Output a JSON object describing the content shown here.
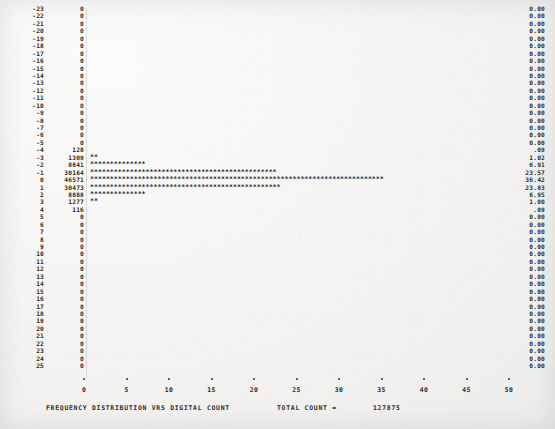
{
  "chart_data": {
    "type": "bar",
    "orientation": "horizontal",
    "title": "FREQUENCY  DISTRIBUTION  VRS  DIGITAL  COUNT",
    "xlabel": "",
    "ylabel": "",
    "xlim": [
      0,
      50
    ],
    "grid": false,
    "legend": null,
    "total_count_label": "TOTAL COUNT  =",
    "total_count_value": "127875",
    "xticks": [
      0,
      5,
      10,
      15,
      20,
      25,
      30,
      35,
      40,
      45,
      50
    ],
    "xticklabels": [
      "0",
      "5",
      "10",
      "15",
      "20",
      "25",
      "30",
      "35",
      "40",
      "45",
      "50"
    ],
    "columns": [
      "digital_count",
      "frequency",
      "histogram",
      "percent"
    ],
    "categories": [
      -23,
      -22,
      -21,
      -20,
      -19,
      -18,
      -17,
      -16,
      -15,
      -14,
      -13,
      -12,
      -11,
      -10,
      -9,
      -8,
      -7,
      -6,
      -5,
      -4,
      -3,
      -2,
      -1,
      0,
      1,
      2,
      3,
      4,
      5,
      6,
      7,
      8,
      9,
      10,
      11,
      12,
      13,
      14,
      15,
      16,
      17,
      18,
      19,
      20,
      21,
      22,
      23,
      24,
      25
    ],
    "values": [
      0,
      0,
      0,
      0,
      0,
      0,
      0,
      0,
      0,
      0,
      0,
      0,
      0,
      0,
      0,
      0,
      0,
      0,
      0,
      128,
      1309,
      8841,
      30164,
      46571,
      30473,
      8888,
      1277,
      116,
      0,
      0,
      0,
      0,
      0,
      0,
      0,
      0,
      0,
      0,
      0,
      0,
      0,
      0,
      0,
      0,
      0,
      0,
      0,
      0,
      0
    ],
    "percents": [
      "0.00",
      "0.00",
      "0.00",
      "0.00",
      "0.00",
      "0.00",
      "0.00",
      "0.00",
      "0.00",
      "0.00",
      "0.00",
      "0.00",
      "0.00",
      "0.00",
      "0.00",
      "0.00",
      "0.00",
      "0.00",
      "0.00",
      ".09",
      "1.02",
      "6.91",
      "23.57",
      "36.42",
      "23.83",
      "6.95",
      "1.00",
      ".09",
      "0.00",
      "0.00",
      "0.00",
      "0.00",
      "0.00",
      "0.00",
      "0.00",
      "0.00",
      "0.00",
      "0.00",
      "0.00",
      "0.00",
      "0.00",
      "0.00",
      "0.00",
      "0.00",
      "0.00",
      "0.00",
      "0.00",
      "0.00",
      "0.00"
    ],
    "bar_stars": [
      0,
      0,
      0,
      0,
      0,
      0,
      0,
      0,
      0,
      0,
      0,
      0,
      0,
      0,
      0,
      0,
      0,
      0,
      0,
      0,
      2,
      14,
      47,
      74,
      48,
      14,
      2,
      0,
      0,
      0,
      0,
      0,
      0,
      0,
      0,
      0,
      0,
      0,
      0,
      0,
      0,
      0,
      0,
      0,
      0,
      0,
      0,
      0,
      0
    ],
    "bar_glyph": "*"
  }
}
